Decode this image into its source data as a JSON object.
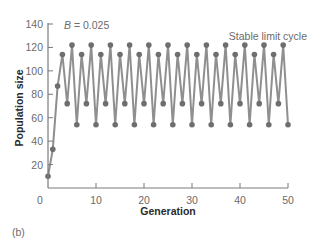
{
  "panel_label": "(b)",
  "annotation_param": {
    "symbol": "B",
    "text": " = 0.025"
  },
  "annotation_regime": "Stable limit cycle",
  "colors": {
    "series": "#8f8f8f",
    "marker": "#6e6e6e",
    "axis": "#7a7a7a",
    "tick_text": "#6b6b6b",
    "title_text": "#2a2a2a"
  },
  "chart_data": {
    "type": "line",
    "title": "B = 0.025",
    "annotations": [
      "B = 0.025",
      "Stable limit cycle"
    ],
    "xlabel": "Generation",
    "ylabel": "Population size",
    "xlim": [
      0,
      50
    ],
    "ylim": [
      0,
      140
    ],
    "xticks": [
      0,
      10,
      20,
      30,
      40,
      50
    ],
    "yticks": [
      20,
      40,
      60,
      80,
      100,
      120,
      140
    ],
    "x_zero_label": "0",
    "grid": false,
    "legend": null,
    "markers": true,
    "series": [
      {
        "name": "Population size",
        "x": [
          0,
          1,
          2,
          3,
          4,
          5,
          6,
          7,
          8,
          9,
          10,
          11,
          12,
          13,
          14,
          15,
          16,
          17,
          18,
          19,
          20,
          21,
          22,
          23,
          24,
          25,
          26,
          27,
          28,
          29,
          30,
          31,
          32,
          33,
          34,
          35,
          36,
          37,
          38,
          39,
          40,
          41,
          42,
          43,
          44,
          45,
          46,
          47,
          48,
          49,
          50
        ],
        "values": [
          10,
          33,
          87,
          114,
          72,
          122,
          54,
          114,
          72,
          122,
          54,
          114,
          72,
          122,
          54,
          114,
          72,
          122,
          54,
          114,
          72,
          122,
          54,
          114,
          72,
          122,
          54,
          114,
          72,
          122,
          54,
          114,
          72,
          122,
          54,
          114,
          72,
          122,
          54,
          114,
          72,
          122,
          54,
          114,
          72,
          122,
          54,
          114,
          72,
          122,
          54
        ]
      }
    ]
  }
}
